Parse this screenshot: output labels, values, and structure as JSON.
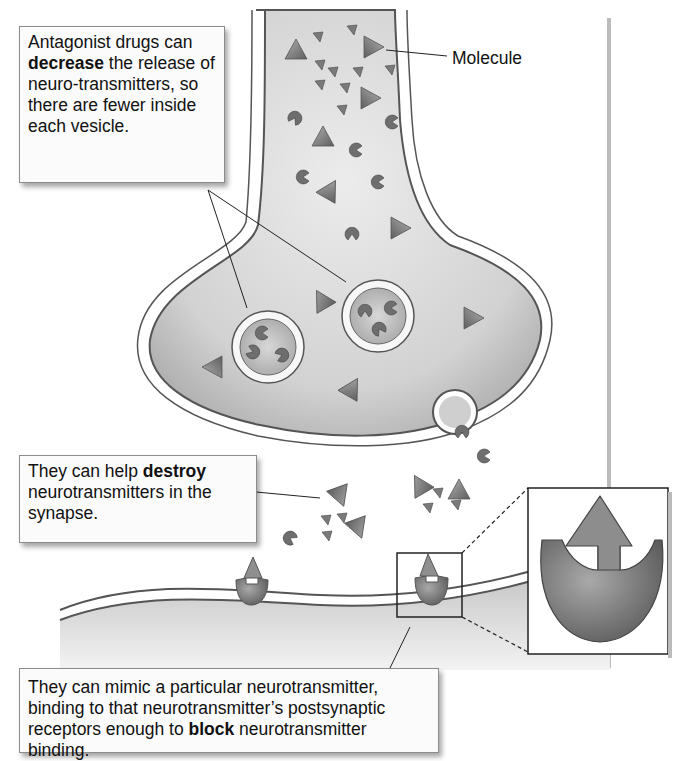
{
  "labels": {
    "molecule": "Molecule"
  },
  "callouts": {
    "decrease": {
      "pre": "Antagonist drugs can ",
      "bold": "decrease",
      "post": " the release of neuro-transmitters, so there are fewer inside each vesicle."
    },
    "destroy": {
      "pre": "They can help ",
      "bold": "destroy",
      "post": " neurotransmitters in the synapse."
    },
    "block": {
      "pre": "They can mimic a particular neurotransmitter, binding to that neurotransmitter’s postsynaptic receptors enough to ",
      "bold": "block",
      "post": " neurotransmitter binding."
    }
  },
  "diagram": {
    "parts": [
      "presynaptic axon terminal",
      "vesicles",
      "molecules",
      "synaptic cleft",
      "postsynaptic membrane",
      "receptors",
      "receptor close-up inset"
    ],
    "colors": {
      "terminal_fill": "#c9c9c9",
      "membrane": "#555555",
      "molecule": "#8a8a8a",
      "receptor": "#7d7d7d",
      "background": "#ffffff"
    }
  }
}
